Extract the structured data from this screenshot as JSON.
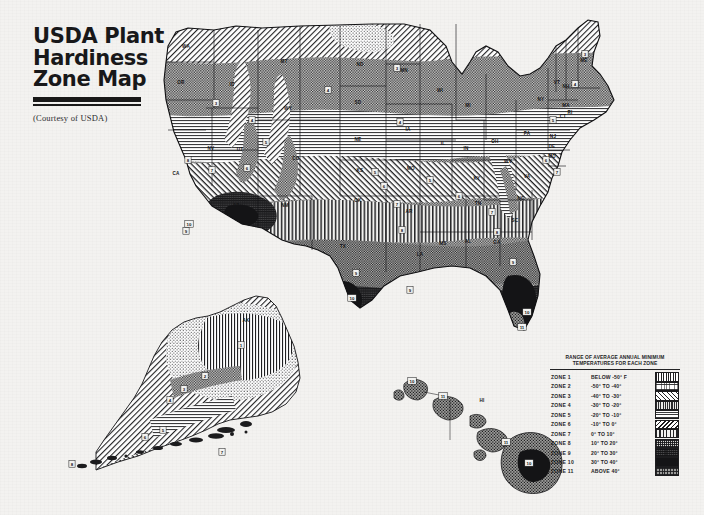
{
  "title": {
    "line1": "USDA Plant",
    "line2": "Hardiness",
    "line3": "Zone Map",
    "courtesy": "(Courtesy of USDA)"
  },
  "legend": {
    "title_line1_a": "RANGE OF AVERAGE ANNUAL ",
    "title_line1_b": "MINIMUM",
    "title_line2": "TEMPERATURES FOR EACH ZONE",
    "rows": [
      {
        "zone": "ZONE 1",
        "range": "BELOW  -50° F",
        "pattern": "p1"
      },
      {
        "zone": "ZONE 2",
        "range": "-50°  TO  -40°",
        "pattern": "p2"
      },
      {
        "zone": "ZONE 3",
        "range": "-40°  TO  -30°",
        "pattern": "p3"
      },
      {
        "zone": "ZONE 4",
        "range": "-30°  TO  -20°",
        "pattern": "p4"
      },
      {
        "zone": "ZONE 5",
        "range": "-20°  TO  -10°",
        "pattern": "p5"
      },
      {
        "zone": "ZONE 6",
        "range": "-10°  TO   0°",
        "pattern": "p6"
      },
      {
        "zone": "ZONE 7",
        "range": "0°  TO  10°",
        "pattern": "p7"
      },
      {
        "zone": "ZONE 8",
        "range": "10°  TO  20°",
        "pattern": "p8"
      },
      {
        "zone": "ZONE 9",
        "range": "20°  TO  30°",
        "pattern": "p9"
      },
      {
        "zone": "ZONE 10",
        "range": "30°  TO  40°",
        "pattern": "p10"
      },
      {
        "zone": "ZONE 11",
        "range": "ABOVE  40°",
        "pattern": "p11"
      }
    ]
  },
  "map": {
    "state_labels": [
      {
        "abbr": "WA",
        "x": 186,
        "y": 48
      },
      {
        "abbr": "OR",
        "x": 181,
        "y": 84
      },
      {
        "abbr": "CA",
        "x": 176,
        "y": 175
      },
      {
        "abbr": "NV",
        "x": 211,
        "y": 150
      },
      {
        "abbr": "ID",
        "x": 232,
        "y": 86
      },
      {
        "abbr": "MT",
        "x": 284,
        "y": 63
      },
      {
        "abbr": "WY",
        "x": 288,
        "y": 110
      },
      {
        "abbr": "UT",
        "x": 240,
        "y": 151
      },
      {
        "abbr": "AZ",
        "x": 236,
        "y": 207
      },
      {
        "abbr": "CO",
        "x": 296,
        "y": 160
      },
      {
        "abbr": "NM",
        "x": 285,
        "y": 207
      },
      {
        "abbr": "ND",
        "x": 360,
        "y": 66
      },
      {
        "abbr": "SD",
        "x": 358,
        "y": 104
      },
      {
        "abbr": "NE",
        "x": 358,
        "y": 141
      },
      {
        "abbr": "KS",
        "x": 360,
        "y": 172
      },
      {
        "abbr": "OK",
        "x": 358,
        "y": 202
      },
      {
        "abbr": "TX",
        "x": 343,
        "y": 248
      },
      {
        "abbr": "MN",
        "x": 404,
        "y": 72
      },
      {
        "abbr": "IA",
        "x": 408,
        "y": 131
      },
      {
        "abbr": "MO",
        "x": 411,
        "y": 170
      },
      {
        "abbr": "AR",
        "x": 409,
        "y": 213
      },
      {
        "abbr": "LA",
        "x": 420,
        "y": 256
      },
      {
        "abbr": "WI",
        "x": 440,
        "y": 92
      },
      {
        "abbr": "IL",
        "x": 443,
        "y": 145
      },
      {
        "abbr": "MS",
        "x": 443,
        "y": 245
      },
      {
        "abbr": "MI",
        "x": 468,
        "y": 107
      },
      {
        "abbr": "IN",
        "x": 466,
        "y": 150
      },
      {
        "abbr": "KY",
        "x": 477,
        "y": 180
      },
      {
        "abbr": "TN",
        "x": 478,
        "y": 205
      },
      {
        "abbr": "AL",
        "x": 468,
        "y": 243
      },
      {
        "abbr": "OH",
        "x": 495,
        "y": 143
      },
      {
        "abbr": "GA",
        "x": 497,
        "y": 244
      },
      {
        "abbr": "WV",
        "x": 508,
        "y": 163
      },
      {
        "abbr": "FL",
        "x": 520,
        "y": 290
      },
      {
        "abbr": "NC",
        "x": 521,
        "y": 200
      },
      {
        "abbr": "SC",
        "x": 515,
        "y": 222
      },
      {
        "abbr": "VA",
        "x": 527,
        "y": 178
      },
      {
        "abbr": "PA",
        "x": 527,
        "y": 135
      },
      {
        "abbr": "NY",
        "x": 541,
        "y": 101
      },
      {
        "abbr": "MD",
        "x": 552,
        "y": 158
      },
      {
        "abbr": "DE",
        "x": 552,
        "y": 148
      },
      {
        "abbr": "NJ",
        "x": 553,
        "y": 138
      },
      {
        "abbr": "CT",
        "x": 563,
        "y": 118
      },
      {
        "abbr": "RI",
        "x": 570,
        "y": 114
      },
      {
        "abbr": "MA",
        "x": 566,
        "y": 107
      },
      {
        "abbr": "VT",
        "x": 557,
        "y": 84
      },
      {
        "abbr": "NH",
        "x": 566,
        "y": 88
      },
      {
        "abbr": "ME",
        "x": 584,
        "y": 62
      },
      {
        "abbr": "AK",
        "x": 246,
        "y": 322
      },
      {
        "abbr": "HI",
        "x": 482,
        "y": 402
      }
    ],
    "zone_markers": [
      {
        "zone": "3",
        "x": 216,
        "y": 103
      },
      {
        "zone": "4",
        "x": 252,
        "y": 120
      },
      {
        "zone": "5",
        "x": 266,
        "y": 142
      },
      {
        "zone": "6",
        "x": 247,
        "y": 168
      },
      {
        "zone": "7",
        "x": 212,
        "y": 170
      },
      {
        "zone": "8",
        "x": 188,
        "y": 160
      },
      {
        "zone": "9",
        "x": 186,
        "y": 231
      },
      {
        "zone": "10",
        "x": 189,
        "y": 224
      },
      {
        "zone": "4",
        "x": 328,
        "y": 90
      },
      {
        "zone": "3",
        "x": 397,
        "y": 68
      },
      {
        "zone": "4",
        "x": 400,
        "y": 122
      },
      {
        "zone": "5",
        "x": 375,
        "y": 172
      },
      {
        "zone": "6",
        "x": 384,
        "y": 186
      },
      {
        "zone": "7",
        "x": 397,
        "y": 204
      },
      {
        "zone": "8",
        "x": 402,
        "y": 230
      },
      {
        "zone": "9",
        "x": 410,
        "y": 290
      },
      {
        "zone": "9",
        "x": 356,
        "y": 273
      },
      {
        "zone": "10",
        "x": 352,
        "y": 298
      },
      {
        "zone": "5",
        "x": 430,
        "y": 180
      },
      {
        "zone": "6",
        "x": 459,
        "y": 196
      },
      {
        "zone": "7",
        "x": 492,
        "y": 212
      },
      {
        "zone": "8",
        "x": 497,
        "y": 232
      },
      {
        "zone": "9",
        "x": 513,
        "y": 262
      },
      {
        "zone": "10",
        "x": 527,
        "y": 312
      },
      {
        "zone": "11",
        "x": 522,
        "y": 327
      },
      {
        "zone": "6",
        "x": 546,
        "y": 160
      },
      {
        "zone": "7",
        "x": 557,
        "y": 172
      },
      {
        "zone": "5",
        "x": 553,
        "y": 120
      },
      {
        "zone": "4",
        "x": 575,
        "y": 84
      },
      {
        "zone": "3",
        "x": 585,
        "y": 54
      },
      {
        "zone": "1",
        "x": 241,
        "y": 345
      },
      {
        "zone": "2",
        "x": 205,
        "y": 376
      },
      {
        "zone": "3",
        "x": 184,
        "y": 389
      },
      {
        "zone": "4",
        "x": 170,
        "y": 400
      },
      {
        "zone": "5",
        "x": 163,
        "y": 430
      },
      {
        "zone": "6",
        "x": 145,
        "y": 437
      },
      {
        "zone": "7",
        "x": 222,
        "y": 452
      },
      {
        "zone": "8",
        "x": 72,
        "y": 464
      },
      {
        "zone": "10",
        "x": 412,
        "y": 381
      },
      {
        "zone": "11",
        "x": 443,
        "y": 396
      },
      {
        "zone": "11",
        "x": 506,
        "y": 442
      },
      {
        "zone": "10",
        "x": 529,
        "y": 463
      }
    ]
  }
}
